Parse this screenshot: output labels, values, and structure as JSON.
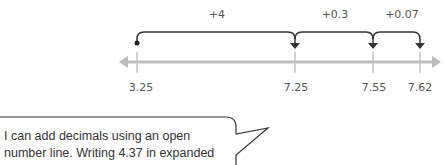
{
  "number_line": {
    "start_value": "3.25",
    "ticks": [
      {
        "label": "3.25",
        "x": 137
      },
      {
        "label": "7.25",
        "x": 295
      },
      {
        "label": "7.55",
        "x": 373
      },
      {
        "label": "7.62",
        "x": 420
      }
    ],
    "jumps": [
      {
        "label": "+4",
        "from": "3.25",
        "to": "7.25",
        "label_x": 217
      },
      {
        "label": "+0.3",
        "from": "7.25",
        "to": "7.55",
        "label_x": 335
      },
      {
        "label": "+0.07",
        "from": "7.55",
        "to": "7.62",
        "label_x": 402
      }
    ],
    "line_color": "#b8b8b8",
    "arc_color": "#333333"
  },
  "speech_bubble": {
    "lines": [
      "I can add decimals using an open",
      "number line. Writing 4.37 in expanded"
    ]
  }
}
